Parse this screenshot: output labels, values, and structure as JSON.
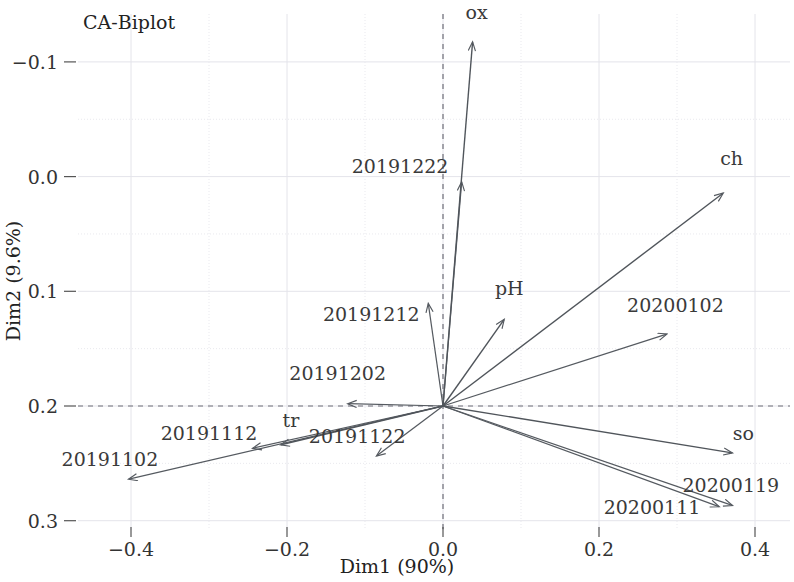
{
  "title": "CA-Biplot",
  "axes": {
    "xlabel": "Dim1 (90%)",
    "ylabel": "Dim2 (9.6%)",
    "xticks": [
      "-0.4",
      "-0.2",
      "0.0",
      "0.2",
      "0.4"
    ],
    "yticks": [
      "0.3",
      "0.2",
      "0.1",
      "0.0",
      "-0.1"
    ]
  },
  "chart_data": {
    "type": "scatter",
    "title": "CA-Biplot",
    "xlabel": "Dim1 (90%)",
    "ylabel": "Dim2 (9.6%)",
    "xlim": [
      -0.47,
      0.45
    ],
    "ylim": [
      -0.115,
      0.345
    ],
    "xticks": [
      -0.4,
      -0.2,
      0.0,
      0.2,
      0.4
    ],
    "yticks": [
      -0.1,
      0.0,
      0.1,
      0.2,
      0.3
    ],
    "grid": true,
    "legend": "none",
    "origin": [
      0.0,
      0.0
    ],
    "note": "Correspondence-analysis biplot: arrows drawn from origin to row (date) and column (variable) coordinates.",
    "column_arrows": [
      {
        "label": "ox",
        "x": 0.038,
        "y": 0.318,
        "label_x": 0.043,
        "label_y": 0.337
      },
      {
        "label": "ch",
        "x": 0.36,
        "y": 0.186,
        "label_x": 0.37,
        "label_y": 0.21
      },
      {
        "label": "pH",
        "x": 0.079,
        "y": 0.076,
        "label_x": 0.085,
        "label_y": 0.097
      },
      {
        "label": "so",
        "x": 0.372,
        "y": -0.041,
        "label_x": 0.385,
        "label_y": -0.03
      },
      {
        "label": "tr",
        "x": -0.209,
        "y": -0.034,
        "label_x": -0.195,
        "label_y": -0.018
      }
    ],
    "row_arrows": [
      {
        "label": "20191222",
        "x": 0.024,
        "y": 0.196,
        "label_x": -0.055,
        "label_y": 0.203
      },
      {
        "label": "20191212",
        "x": -0.019,
        "y": 0.09,
        "label_x": -0.092,
        "label_y": 0.074
      },
      {
        "label": "20191202",
        "x": -0.123,
        "y": 0.002,
        "label_x": -0.135,
        "label_y": 0.023
      },
      {
        "label": "20191122",
        "x": -0.086,
        "y": -0.044,
        "label_x": -0.11,
        "label_y": -0.032
      },
      {
        "label": "20191112",
        "x": -0.245,
        "y": -0.037,
        "label_x": -0.3,
        "label_y": -0.03
      },
      {
        "label": "20191102",
        "x": -0.404,
        "y": -0.064,
        "label_x": -0.427,
        "label_y": -0.052
      },
      {
        "label": "20200102",
        "x": 0.288,
        "y": 0.063,
        "label_x": 0.298,
        "label_y": 0.082
      },
      {
        "label": "20200111",
        "x": 0.355,
        "y": -0.088,
        "label_x": 0.268,
        "label_y": -0.094
      },
      {
        "label": "20200119",
        "x": 0.372,
        "y": -0.087,
        "label_x": 0.369,
        "label_y": -0.075
      }
    ]
  },
  "colors": {
    "arrow": "#555a60",
    "grid": "#e9e9ee",
    "zero_line": "#6f6f78",
    "text": "#333333",
    "background": "#ffffff"
  }
}
